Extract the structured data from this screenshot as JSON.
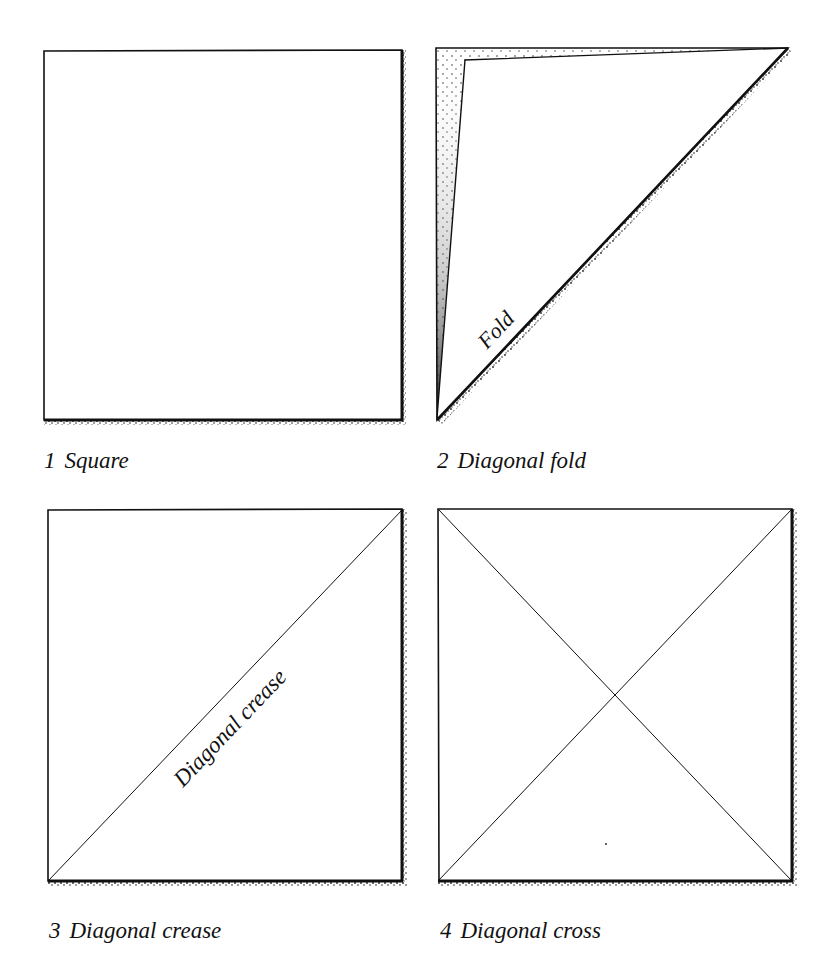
{
  "figures": [
    {
      "number": "1",
      "title": "Square",
      "inner_label": ""
    },
    {
      "number": "2",
      "title": "Diagonal fold",
      "inner_label": "Fold"
    },
    {
      "number": "3",
      "title": "Diagonal crease",
      "inner_label": "Diagonal crease"
    },
    {
      "number": "4",
      "title": "Diagonal cross",
      "inner_label": ""
    }
  ],
  "colors": {
    "ink": "#111111",
    "paper": "#ffffff",
    "stipple": "#333333"
  }
}
